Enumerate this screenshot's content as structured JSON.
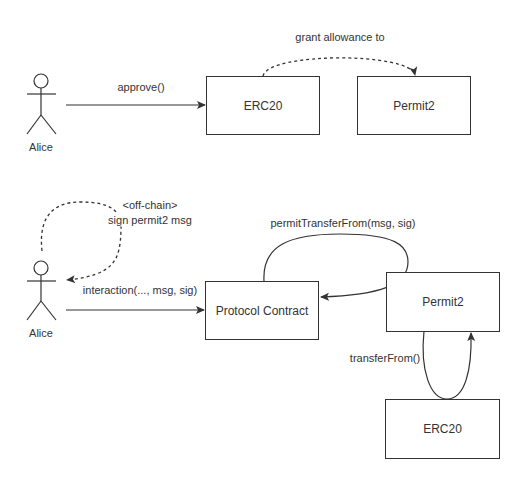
{
  "diagram": {
    "top": {
      "actor": {
        "name": "Alice"
      },
      "boxes": {
        "erc20": "ERC20",
        "permit2": "Permit2"
      },
      "edges": {
        "approve": "approve()",
        "grant": "grant allowance to"
      }
    },
    "bottom": {
      "actor": {
        "name": "Alice"
      },
      "boxes": {
        "protocol": "Protocol Contract",
        "permit2": "Permit2",
        "erc20": "ERC20"
      },
      "edges": {
        "sign_line1": "<off-chain>",
        "sign_line2": "sign permit2 msg",
        "interaction": "interaction(..., msg, sig)",
        "permit_transfer": "permitTransferFrom(msg, sig)",
        "transfer_from": "transferFrom()"
      }
    },
    "colors": {
      "stroke": "#333333",
      "background": "#ffffff"
    }
  }
}
